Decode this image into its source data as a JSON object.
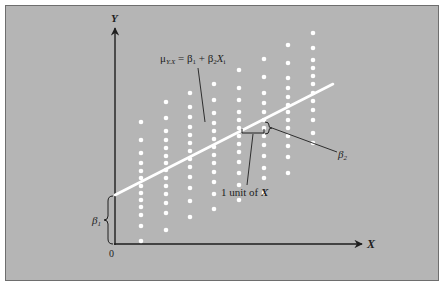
{
  "figure": {
    "background_color": "#b5b5b5",
    "border_color": "#6e6e6e",
    "dot_color": "#ffffff",
    "line_color": "#ffffff",
    "ink_color": "#1e1e1e"
  },
  "axes": {
    "y_label": "Y",
    "x_label": "X",
    "origin_label": "0"
  },
  "annotations": {
    "equation_mu": "μ",
    "equation_mu_sub": "Y.X",
    "equation_rest": " = β",
    "equation_b1_sub": "1",
    "equation_plus": " + β",
    "equation_b2_sub": "2",
    "equation_x": "X",
    "equation_x_sub": "i",
    "intercept_label": "β",
    "intercept_sub": "1",
    "slope_label": "β",
    "slope_sub": "2",
    "unit_label_prefix": "1 unit of ",
    "unit_label_var": "X"
  },
  "chart_data": {
    "type": "scatter",
    "title": "",
    "xlabel": "X",
    "ylabel": "Y",
    "grid": false,
    "legend": "none",
    "regression_line": {
      "x0": 115,
      "y0": 195,
      "x1": 333,
      "y1": 84
    },
    "columns": [
      {
        "x": 141,
        "ys": [
          122,
          140,
          153,
          163,
          171,
          178,
          186,
          193,
          200,
          207,
          215,
          226,
          241
        ]
      },
      {
        "x": 166,
        "ys": [
          102,
          118,
          131,
          140,
          148,
          156,
          163,
          170,
          178,
          186,
          194,
          203,
          213,
          230
        ]
      },
      {
        "x": 190,
        "ys": [
          93,
          107,
          117,
          127,
          135,
          143,
          151,
          159,
          167,
          177,
          188,
          201,
          217
        ]
      },
      {
        "x": 214,
        "ys": [
          84,
          100,
          113,
          123,
          131,
          139,
          147,
          155,
          163,
          172,
          182,
          194,
          209
        ]
      },
      {
        "x": 239,
        "ys": [
          70,
          88,
          100,
          112,
          120,
          128,
          136,
          144,
          152,
          162,
          173,
          185,
          200
        ]
      },
      {
        "x": 264,
        "ys": [
          59,
          77,
          93,
          103,
          112,
          120,
          128,
          136,
          145,
          156,
          168,
          178,
          193
        ]
      },
      {
        "x": 288,
        "ys": [
          45,
          63,
          78,
          88,
          97,
          105,
          112,
          120,
          128,
          136,
          146,
          157,
          173
        ]
      },
      {
        "x": 313,
        "ys": [
          33,
          48,
          60,
          68,
          76,
          84,
          93,
          101,
          110,
          120,
          133,
          143
        ]
      }
    ]
  }
}
